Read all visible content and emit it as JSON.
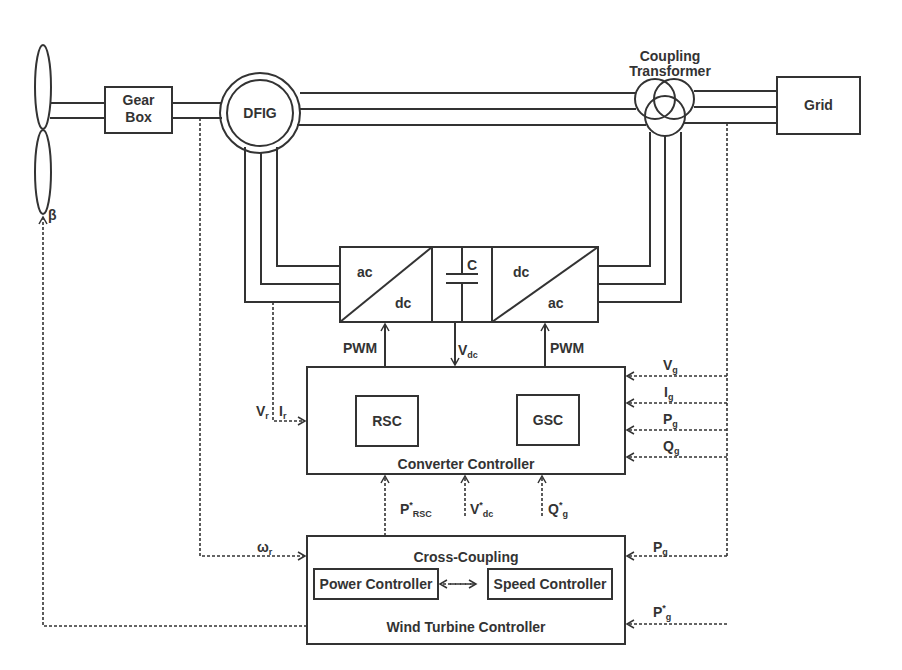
{
  "blocks": {
    "gearbox": [
      "Gear",
      "Box"
    ],
    "dfig": "DFIG",
    "transformer": [
      "Coupling",
      "Transformer"
    ],
    "grid": "Grid",
    "rsc_converter": {
      "top": "ac",
      "bottom": "dc"
    },
    "dc_link": "C",
    "gsc_converter": {
      "top": "dc",
      "bottom": "ac"
    },
    "converter_controller": {
      "title": "Converter Controller",
      "rsc": "RSC",
      "gsc": "GSC"
    },
    "wind_turbine_controller": {
      "title": "Wind Turbine Controller",
      "cross_coupling": "Cross-Coupling",
      "power_controller": "Power Controller",
      "speed_controller": "Speed Controller"
    }
  },
  "signals": {
    "beta": "β",
    "pwm_left": "PWM",
    "pwm_right": "PWM",
    "vdc": {
      "base": "V",
      "sub": "dc"
    },
    "vr": {
      "base": "V",
      "sub": "r"
    },
    "ir": {
      "base": "I",
      "sub": "r"
    },
    "vg": {
      "base": "V",
      "sub": "g"
    },
    "ig": {
      "base": "I",
      "sub": "g"
    },
    "pg": {
      "base": "P",
      "sub": "g"
    },
    "qg": {
      "base": "Q",
      "sub": "g"
    },
    "p_rsc_ref": {
      "base": "P",
      "sup": "*",
      "sub": "RSC"
    },
    "vdc_ref": {
      "base": "V",
      "sup": "*",
      "sub": "dc"
    },
    "qg_ref": {
      "base": "Q",
      "sup": "*",
      "sub": "g"
    },
    "omega_r": {
      "base": "ω",
      "sub": "r"
    },
    "pg_wtc": {
      "base": "P",
      "sub": "g"
    },
    "pg_ref": {
      "base": "P",
      "sup": "*",
      "sub": "g"
    }
  }
}
